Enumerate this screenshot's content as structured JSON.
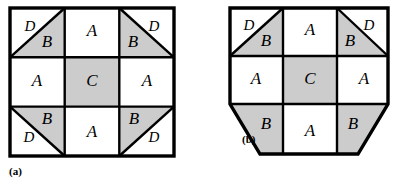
{
  "figures": [
    {
      "id": "a",
      "caption": "(a)",
      "shape": "square",
      "grid": {
        "rows": 3,
        "cols": 3
      },
      "colors": {
        "fill_gray": "#cccccc",
        "fill_white": "#ffffff",
        "stroke": "#000000"
      },
      "cells": [
        {
          "row": 0,
          "col": 0,
          "type": "split-diagonal",
          "diagonal": "tlbr",
          "regions": [
            {
              "label": "D",
              "fill": "white",
              "side": "upper-left"
            },
            {
              "label": "B",
              "fill": "gray",
              "side": "lower-right"
            }
          ]
        },
        {
          "row": 0,
          "col": 1,
          "type": "plain",
          "label": "A",
          "fill": "white"
        },
        {
          "row": 0,
          "col": 2,
          "type": "split-diagonal",
          "diagonal": "trbl",
          "regions": [
            {
              "label": "D",
              "fill": "white",
              "side": "upper-right"
            },
            {
              "label": "B",
              "fill": "gray",
              "side": "lower-left"
            }
          ]
        },
        {
          "row": 1,
          "col": 0,
          "type": "plain",
          "label": "A",
          "fill": "white"
        },
        {
          "row": 1,
          "col": 1,
          "type": "plain",
          "label": "C",
          "fill": "gray"
        },
        {
          "row": 1,
          "col": 2,
          "type": "plain",
          "label": "A",
          "fill": "white"
        },
        {
          "row": 2,
          "col": 0,
          "type": "split-diagonal",
          "diagonal": "trbl",
          "regions": [
            {
              "label": "B",
              "fill": "gray",
              "side": "upper-right"
            },
            {
              "label": "D",
              "fill": "white",
              "side": "lower-left"
            }
          ]
        },
        {
          "row": 2,
          "col": 1,
          "type": "plain",
          "label": "A",
          "fill": "white"
        },
        {
          "row": 2,
          "col": 2,
          "type": "split-diagonal",
          "diagonal": "tlbr",
          "regions": [
            {
              "label": "B",
              "fill": "gray",
              "side": "upper-left"
            },
            {
              "label": "D",
              "fill": "white",
              "side": "lower-right"
            }
          ]
        }
      ]
    },
    {
      "id": "b",
      "caption": "(b)",
      "shape": "square-with-bottom-corners-chamfered",
      "grid": {
        "rows": 3,
        "cols": 3
      },
      "colors": {
        "fill_gray": "#cccccc",
        "fill_white": "#ffffff",
        "stroke": "#000000"
      },
      "cells": [
        {
          "row": 0,
          "col": 0,
          "type": "split-diagonal",
          "diagonal": "tlbr",
          "regions": [
            {
              "label": "D",
              "fill": "white",
              "side": "upper-left"
            },
            {
              "label": "B",
              "fill": "gray",
              "side": "lower-right"
            }
          ]
        },
        {
          "row": 0,
          "col": 1,
          "type": "plain",
          "label": "A",
          "fill": "white"
        },
        {
          "row": 0,
          "col": 2,
          "type": "split-diagonal",
          "diagonal": "trbl",
          "regions": [
            {
              "label": "D",
              "fill": "white",
              "side": "upper-right"
            },
            {
              "label": "B",
              "fill": "gray",
              "side": "lower-left"
            }
          ]
        },
        {
          "row": 1,
          "col": 0,
          "type": "plain",
          "label": "A",
          "fill": "white"
        },
        {
          "row": 1,
          "col": 1,
          "type": "plain",
          "label": "C",
          "fill": "gray"
        },
        {
          "row": 1,
          "col": 2,
          "type": "plain",
          "label": "A",
          "fill": "white"
        },
        {
          "row": 2,
          "col": 0,
          "type": "chamfered-trapezoid",
          "corner": "bottom-left",
          "label": "B",
          "fill": "gray"
        },
        {
          "row": 2,
          "col": 1,
          "type": "plain",
          "label": "A",
          "fill": "white"
        },
        {
          "row": 2,
          "col": 2,
          "type": "chamfered-trapezoid",
          "corner": "bottom-right",
          "label": "B",
          "fill": "gray"
        }
      ]
    }
  ],
  "labels": {
    "a_r0c0_D": "D",
    "a_r0c0_B": "B",
    "a_r0c1_A": "A",
    "a_r0c2_D": "D",
    "a_r0c2_B": "B",
    "a_r1c0_A": "A",
    "a_r1c1_C": "C",
    "a_r1c2_A": "A",
    "a_r2c0_B": "B",
    "a_r2c0_D": "D",
    "a_r2c1_A": "A",
    "a_r2c2_B": "B",
    "a_r2c2_D": "D",
    "b_r0c0_D": "D",
    "b_r0c0_B": "B",
    "b_r0c1_A": "A",
    "b_r0c2_D": "D",
    "b_r0c2_B": "B",
    "b_r1c0_A": "A",
    "b_r1c1_C": "C",
    "b_r1c2_A": "A",
    "b_r2c0_B": "B",
    "b_r2c1_A": "A",
    "b_r2c2_B": "B",
    "caption_a": "(a)",
    "caption_b": "(b)"
  }
}
